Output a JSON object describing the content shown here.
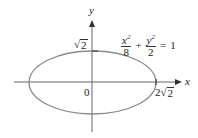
{
  "diagram": {
    "type": "ellipse-graph",
    "equation": {
      "term1_num": "x",
      "term1_exp": "2",
      "term1_den": "8",
      "plus": "+",
      "term2_num": "y",
      "term2_exp": "2",
      "term2_den": "2",
      "equals": "=",
      "rhs": "1"
    },
    "axes": {
      "x_label": "x",
      "y_label": "y",
      "origin_label": "0"
    },
    "intercepts": {
      "y_intercept_label_sym": "√",
      "y_intercept_label_rad": "2",
      "x_intercept_coeff": "2",
      "x_intercept_sym": "√",
      "x_intercept_rad": "2"
    },
    "colors": {
      "ellipse": "#8a8a8a",
      "axes": "#555555",
      "text": "#222222"
    }
  }
}
